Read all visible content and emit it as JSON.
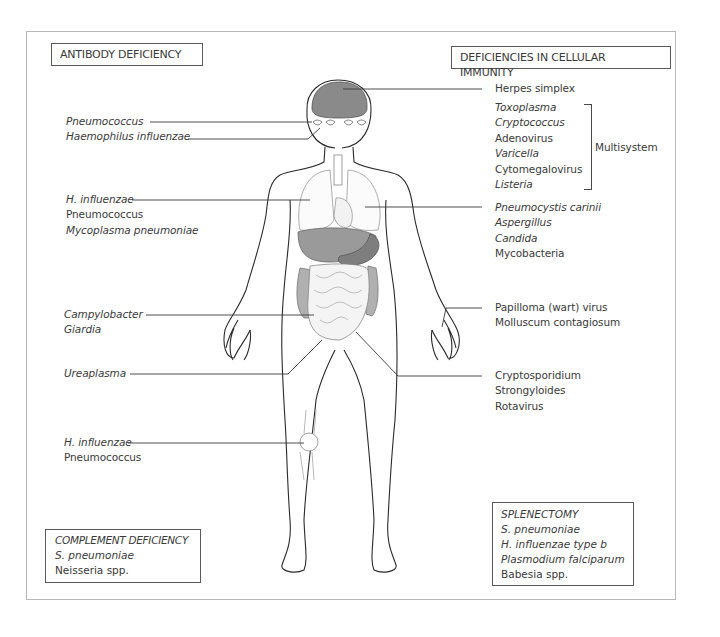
{
  "diagram": {
    "title_left": "ANTIBODY DEFICIENCY",
    "title_right": "DEFICIENCIES IN CELLULAR IMMUNITY",
    "left_labels": {
      "head": [
        {
          "text": "Pneumococcus",
          "italic": true
        },
        {
          "text": "Haemophilus influenzae",
          "italic": true
        }
      ],
      "lungs": [
        {
          "text": "H. influenzae",
          "italic": true
        },
        {
          "text": "Pneumococcus",
          "italic": false
        },
        {
          "text": "Mycoplasma pneumoniae",
          "italic": true
        }
      ],
      "gut": [
        {
          "text": "Campylobacter",
          "italic": true
        },
        {
          "text": "Giardia",
          "italic": true
        }
      ],
      "urogenital": [
        {
          "text": "Ureaplasma",
          "italic": true
        }
      ],
      "joints": [
        {
          "text": "H. influenzae",
          "italic": true
        },
        {
          "text": "Pneumococcus",
          "italic": false
        }
      ]
    },
    "right_labels": {
      "brain": [
        {
          "text": "Herpes simplex",
          "italic": false
        }
      ],
      "multisystem": [
        {
          "text": "Toxoplasma",
          "italic": true
        },
        {
          "text": "Cryptococcus",
          "italic": true
        },
        {
          "text": "Adenovirus",
          "italic": false
        },
        {
          "text": "Varicella",
          "italic": true
        },
        {
          "text": "Cytomegalovirus",
          "italic": false
        },
        {
          "text": "Listeria",
          "italic": true
        }
      ],
      "multisystem_label": "Multisystem",
      "lungs": [
        {
          "text": "Pneumocystis carinii",
          "italic": true
        },
        {
          "text": "Aspergillus",
          "italic": true
        },
        {
          "text": "Candida",
          "italic": true
        },
        {
          "text": "Mycobacteria",
          "italic": false
        }
      ],
      "skin": [
        {
          "text": "Papilloma (wart) virus",
          "italic": false
        },
        {
          "text": "Molluscum contagiosum",
          "italic": false
        }
      ],
      "gut": [
        {
          "text": "Cryptosporidium",
          "italic": false
        },
        {
          "text": "Strongyloides",
          "italic": false
        },
        {
          "text": "Rotavirus",
          "italic": false
        }
      ]
    },
    "complement_box": {
      "title": "COMPLEMENT DEFICIENCY",
      "items": [
        "S. pneumoniae",
        "Neisseria spp."
      ]
    },
    "splenectomy_box": {
      "title": "SPLENECTOMY",
      "items": [
        "S. pneumoniae",
        "H. influenzae type b",
        "Plasmodium falciparum",
        "Babesia spp."
      ]
    },
    "colors": {
      "brain": "#8a8a8a",
      "liver": "#9a9a9a",
      "stomach": "#7e7e7e",
      "colon": "#b0b0b0",
      "outline": "#2a2a2a",
      "frame": "#b8b8b8"
    }
  }
}
